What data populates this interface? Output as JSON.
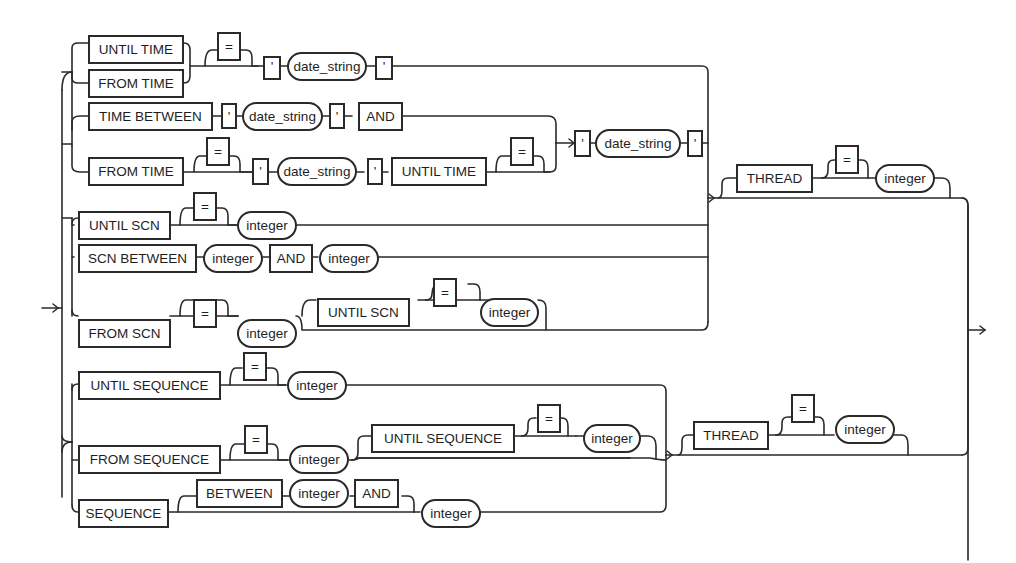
{
  "diagram": {
    "type": "railroad-syntax-diagram",
    "groups": {
      "time": {
        "rows": [
          {
            "tokens": [
              [
                "UNTIL TIME",
                "FROM TIME"
              ],
              "[=]",
              "'",
              "date_string",
              "'"
            ]
          },
          {
            "tokens": [
              "TIME BETWEEN",
              "'",
              "date_string",
              "'",
              "AND"
            ]
          },
          {
            "tokens": [
              "FROM TIME",
              "[=]",
              "'",
              "date_string",
              "'",
              "UNTIL TIME",
              "[=]"
            ]
          },
          {
            "shared_tail": [
              "'",
              "date_string",
              "'"
            ]
          }
        ]
      },
      "scn": {
        "rows": [
          {
            "tokens": [
              "UNTIL SCN",
              "[=]",
              "integer"
            ]
          },
          {
            "tokens": [
              "SCN BETWEEN",
              "integer",
              "AND",
              "integer"
            ]
          },
          {
            "tokens": [
              "FROM SCN",
              "[=]",
              "integer",
              "[UNTIL SCN [=] integer]"
            ]
          }
        ],
        "optional_thread": [
          "THREAD",
          "[=]",
          "integer"
        ]
      },
      "sequence": {
        "rows": [
          {
            "tokens": [
              "UNTIL SEQUENCE",
              "[=]",
              "integer"
            ]
          },
          {
            "tokens": [
              "FROM SEQUENCE",
              "[=]",
              "integer",
              "[UNTIL SEQUENCE [=] integer]"
            ]
          },
          {
            "tokens": [
              "SEQUENCE",
              "[BETWEEN integer AND]",
              "integer"
            ]
          }
        ],
        "optional_thread": [
          "THREAD",
          "[=]",
          "integer"
        ]
      }
    },
    "labels": {
      "until_time": "UNTIL TIME",
      "from_time": "FROM TIME",
      "time_between": "TIME BETWEEN",
      "and": "AND",
      "quote": "'",
      "equals": "=",
      "date_string": "date_string",
      "until_scn": "UNTIL SCN",
      "scn_between": "SCN BETWEEN",
      "from_scn": "FROM SCN",
      "integer": "integer",
      "thread": "THREAD",
      "until_sequence": "UNTIL SEQUENCE",
      "from_sequence": "FROM SEQUENCE",
      "sequence": "SEQUENCE",
      "between": "BETWEEN"
    }
  }
}
